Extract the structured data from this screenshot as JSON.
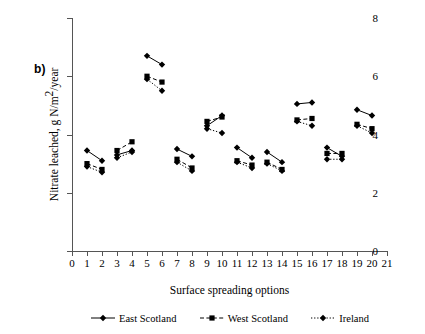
{
  "figure": {
    "panel_label": "b)"
  },
  "chart_data": {
    "type": "scatter",
    "title": "",
    "xlabel": "Surface spreading options",
    "ylabel": "Nitrate leached, g N/m²/year",
    "ylabel_plain": "Nitrate leached, g N/m",
    "ylabel_sup": "2",
    "ylabel_tail": "/year",
    "xlim": [
      0,
      21
    ],
    "ylim": [
      0,
      8
    ],
    "xticks": [
      0,
      1,
      2,
      3,
      4,
      5,
      6,
      7,
      8,
      9,
      10,
      11,
      12,
      13,
      14,
      15,
      16,
      17,
      18,
      19,
      20,
      21
    ],
    "yticks": [
      0,
      2,
      4,
      6,
      8
    ],
    "xticklabels": [
      "0",
      "1",
      "2",
      "3",
      "4",
      "5",
      "6",
      "7",
      "8",
      "9",
      "10",
      "11",
      "12",
      "13",
      "14",
      "15",
      "16",
      "17",
      "18",
      "19",
      "20",
      "21"
    ],
    "yticklabels": [
      "0",
      "2",
      "4",
      "6",
      "8"
    ],
    "grid": false,
    "legend_position": "below",
    "x": [
      1,
      2,
      3,
      4,
      5,
      6,
      7,
      8,
      9,
      10,
      11,
      12,
      13,
      14,
      15,
      16,
      17,
      18,
      19,
      20
    ],
    "pairs": [
      [
        1,
        2
      ],
      [
        3,
        4
      ],
      [
        5,
        6
      ],
      [
        7,
        8
      ],
      [
        9,
        10
      ],
      [
        11,
        12
      ],
      [
        13,
        14
      ],
      [
        15,
        16
      ],
      [
        17,
        18
      ],
      [
        19,
        20
      ]
    ],
    "series": [
      {
        "name": "East Scotland",
        "marker": "diamond",
        "line": "solid",
        "color": "#000000",
        "values": [
          3.45,
          3.1,
          3.3,
          3.45,
          6.7,
          6.4,
          3.5,
          3.25,
          4.3,
          4.65,
          3.55,
          3.2,
          3.4,
          3.05,
          5.05,
          5.1,
          3.55,
          3.25,
          4.85,
          4.65
        ]
      },
      {
        "name": "West Scotland",
        "marker": "square",
        "line": "dashed",
        "color": "#000000",
        "values": [
          3.0,
          2.8,
          3.45,
          3.75,
          6.0,
          5.8,
          3.15,
          2.85,
          4.45,
          4.6,
          3.1,
          2.95,
          3.05,
          2.8,
          4.5,
          4.55,
          3.35,
          3.35,
          4.35,
          4.2
        ]
      },
      {
        "name": "Ireland",
        "marker": "diamond",
        "line": "dotted",
        "color": "#000000",
        "values": [
          2.9,
          2.7,
          3.2,
          3.4,
          5.9,
          5.5,
          3.05,
          2.75,
          4.2,
          4.05,
          3.05,
          2.85,
          3.0,
          2.75,
          4.45,
          4.3,
          3.15,
          3.15,
          4.3,
          4.05
        ]
      }
    ]
  }
}
